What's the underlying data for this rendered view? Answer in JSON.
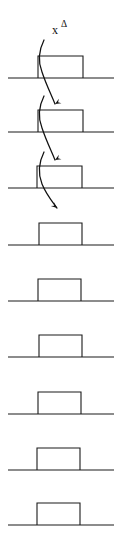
{
  "figure": {
    "background_color": "#ffffff",
    "line_color": "#1a1a1a",
    "arrow_color": "#111111",
    "width": 122,
    "height": 544,
    "label": {
      "base": "x",
      "superscript": "Δ",
      "full_text": "xΔ",
      "x": 52,
      "y": 34
    },
    "rows": [
      {
        "index": 1,
        "baseline_y": 78,
        "baseline_x1": 8,
        "baseline_x2": 114,
        "pulse_left": 38,
        "pulse_right": 83,
        "pulse_top": 56
      },
      {
        "index": 2,
        "baseline_y": 132,
        "baseline_x1": 8,
        "baseline_x2": 114,
        "pulse_left": 38,
        "pulse_right": 83,
        "pulse_top": 110
      },
      {
        "index": 3,
        "baseline_y": 188,
        "baseline_x1": 8,
        "baseline_x2": 114,
        "pulse_left": 37,
        "pulse_right": 82,
        "pulse_top": 166
      },
      {
        "index": 4,
        "baseline_y": 245,
        "baseline_x1": 8,
        "baseline_x2": 114,
        "pulse_left": 39,
        "pulse_right": 82,
        "pulse_top": 223
      },
      {
        "index": 5,
        "baseline_y": 301,
        "baseline_x1": 8,
        "baseline_x2": 114,
        "pulse_left": 38,
        "pulse_right": 81,
        "pulse_top": 279
      },
      {
        "index": 6,
        "baseline_y": 357,
        "baseline_x1": 8,
        "baseline_x2": 114,
        "pulse_left": 39,
        "pulse_right": 82,
        "pulse_top": 335
      },
      {
        "index": 7,
        "baseline_y": 414,
        "baseline_x1": 8,
        "baseline_x2": 114,
        "pulse_left": 38,
        "pulse_right": 81,
        "pulse_top": 392
      },
      {
        "index": 8,
        "baseline_y": 470,
        "baseline_x1": 8,
        "baseline_x2": 114,
        "pulse_left": 37,
        "pulse_right": 80,
        "pulse_top": 448
      },
      {
        "index": 9,
        "baseline_y": 525,
        "baseline_x1": 8,
        "baseline_x2": 114,
        "pulse_left": 37,
        "pulse_right": 80,
        "pulse_top": 503
      }
    ],
    "arrows": [
      {
        "index": 1,
        "from_row": 1,
        "to_row": 2,
        "direction": "down-then-up",
        "path": "M 44 40 C 38 52, 38 62, 42 72 C 46 84, 50 92, 55 104",
        "head_points": "55,104 48,98 53,96",
        "head_rotation": 150
      },
      {
        "index": 2,
        "from_row": 2,
        "to_row": 3,
        "direction": "down-then-up",
        "path": "M 44 96 C 38 108, 38 118, 42 128 C 46 140, 50 148, 55 160",
        "head_points": "55,160 48,154 53,152",
        "head_rotation": 150
      },
      {
        "index": 3,
        "from_row": 3,
        "to_row": 4,
        "direction": "down-right",
        "path": "M 44 152 C 38 164, 38 174, 42 184 C 46 194, 51 200, 57 208",
        "head_points": "57,208 49,204 53,199",
        "head_rotation": 40
      }
    ]
  }
}
